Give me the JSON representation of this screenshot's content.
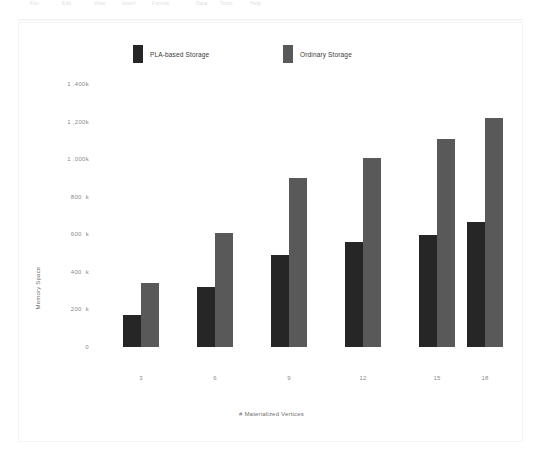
{
  "toolbar": {
    "items": [
      {
        "label": "File",
        "x": 30
      },
      {
        "label": "Edit",
        "x": 62
      },
      {
        "label": "View",
        "x": 94
      },
      {
        "label": "Insert",
        "x": 122
      },
      {
        "label": "Format",
        "x": 152
      },
      {
        "label": "Data",
        "x": 196
      },
      {
        "label": "Tools",
        "x": 220
      },
      {
        "label": "Help",
        "x": 250
      }
    ]
  },
  "chart_data": {
    "type": "bar",
    "title": "",
    "xlabel": "# Materialized Vertices",
    "ylabel": "Memory Space",
    "categories": [
      "3",
      "6",
      "9",
      "12",
      "15",
      "18"
    ],
    "series": [
      {
        "name": "PLA-based Storage",
        "color": "#262626",
        "values": [
          170,
          320,
          491,
          561,
          598,
          668
        ]
      },
      {
        "name": "Ordinary Storage",
        "color": "#595959",
        "values": [
          342,
          609,
          897,
          1004,
          1106,
          1218
        ]
      }
    ],
    "ylim": [
      0,
      1400
    ],
    "y_tick_values": [
      0,
      200,
      400,
      600,
      800,
      1000,
      1200,
      1400
    ],
    "y_tick_labels": [
      "0",
      "200  k",
      "400  k",
      "600  k",
      "800  k",
      "1 ,000k",
      "1 ,200k",
      "1 ,400k"
    ],
    "y_unit": "k",
    "grid": false,
    "legend_position": "top"
  }
}
